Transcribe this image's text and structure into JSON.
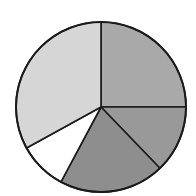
{
  "chart_data": {
    "type": "pie",
    "title": "",
    "labels": [],
    "start_angle_deg": 0,
    "direction": "clockwise",
    "slices": [
      {
        "value": 25.0,
        "color": "#a9a9a9"
      },
      {
        "value": 12.8,
        "color": "#999999"
      },
      {
        "value": 20.0,
        "color": "#8e8e8e"
      },
      {
        "value": 9.2,
        "color": "#ffffff"
      },
      {
        "value": 33.0,
        "color": "#d6d6d6"
      }
    ],
    "center": [
      101,
      107
    ],
    "radius": 85,
    "stroke": "#1a1a1a"
  }
}
